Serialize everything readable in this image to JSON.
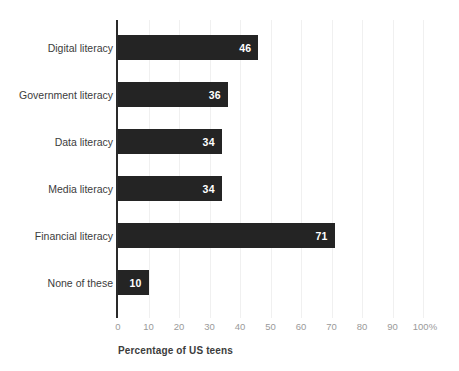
{
  "chart_data": {
    "type": "bar",
    "orientation": "horizontal",
    "title": "",
    "subtitle": "",
    "xlabel": "Percentage of US teens",
    "ylabel": "",
    "categories": [
      "Digital literacy",
      "Government literacy",
      "Data literacy",
      "Media literacy",
      "Financial literacy",
      "None of these"
    ],
    "values": [
      46,
      36,
      34,
      34,
      71,
      10
    ],
    "value_labels": [
      "46",
      "36",
      "34",
      "34",
      "71",
      "10"
    ],
    "xlim": [
      0,
      100
    ],
    "xticks": [
      0,
      10,
      20,
      30,
      40,
      50,
      60,
      70,
      80,
      90,
      100
    ],
    "xtick_labels": [
      "0",
      "10",
      "20",
      "30",
      "40",
      "50",
      "60",
      "70",
      "80",
      "90",
      "100%"
    ],
    "grid": true,
    "grid_axis": "x",
    "legend": false,
    "legend_position": "none",
    "annotations": [],
    "series": [
      {
        "name": "Percentage of US teens",
        "values": [
          46,
          36,
          34,
          34,
          71,
          10
        ]
      }
    ]
  },
  "style": {
    "bar_color": "#242424",
    "value_label_color": "#ffffff",
    "category_label_color": "#3c3c3c",
    "tick_label_color": "#9a9a9a",
    "axis_line_color": "#2a2a2a",
    "gridline_color": "#f0f0f0",
    "background_color": "#ffffff"
  }
}
